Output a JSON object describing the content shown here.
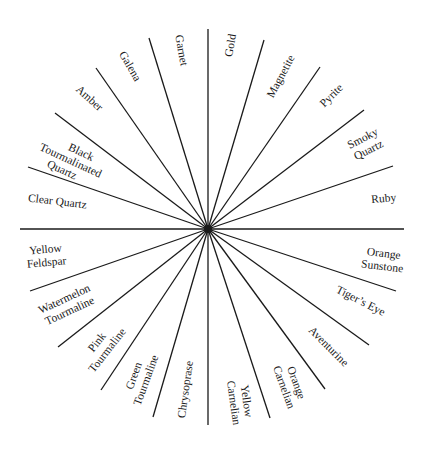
{
  "diagram": {
    "type": "radial-wheel",
    "center": [
      208,
      229
    ],
    "line_color": "#1a1a1a",
    "background": "#ffffff",
    "segments": [
      {
        "id": "gold",
        "lines": [
          "Gold"
        ]
      },
      {
        "id": "magnetite",
        "lines": [
          "Magnetite"
        ]
      },
      {
        "id": "pyrite",
        "lines": [
          "Pyrite"
        ]
      },
      {
        "id": "smoky-quartz",
        "lines": [
          "Smoky",
          "Quartz"
        ]
      },
      {
        "id": "ruby",
        "lines": [
          "Ruby"
        ]
      },
      {
        "id": "orange-sunstone",
        "lines": [
          "Orange",
          "Sunstone"
        ]
      },
      {
        "id": "tigers-eye",
        "lines": [
          "Tiger’s Eye"
        ]
      },
      {
        "id": "aventurine",
        "lines": [
          "Aventurine"
        ]
      },
      {
        "id": "orange-carnelian",
        "lines": [
          "Orange",
          "Carnelian"
        ]
      },
      {
        "id": "yellow-carnelian",
        "lines": [
          "Yellow",
          "Carnelian"
        ]
      },
      {
        "id": "chrysoprase",
        "lines": [
          "Chrysoprase"
        ]
      },
      {
        "id": "green-tourmaline",
        "lines": [
          "Green",
          "Tourmaline"
        ]
      },
      {
        "id": "pink-tourmaline",
        "lines": [
          "Pink",
          "Tourmaline"
        ]
      },
      {
        "id": "watermelon-tourmaline",
        "lines": [
          "Watermelon",
          "Tourmaline"
        ]
      },
      {
        "id": "yellow-feldspar",
        "lines": [
          "Yellow",
          "Feldspar"
        ]
      },
      {
        "id": "clear-quartz",
        "lines": [
          "Clear Quartz"
        ]
      },
      {
        "id": "black-tourmalinated-quartz",
        "lines": [
          "Black",
          "Tourmalinated",
          "Quartz"
        ]
      },
      {
        "id": "amber",
        "lines": [
          "Amber"
        ]
      },
      {
        "id": "galena",
        "lines": [
          "Galena"
        ]
      },
      {
        "id": "garnet",
        "lines": [
          "Garnet"
        ]
      }
    ]
  }
}
